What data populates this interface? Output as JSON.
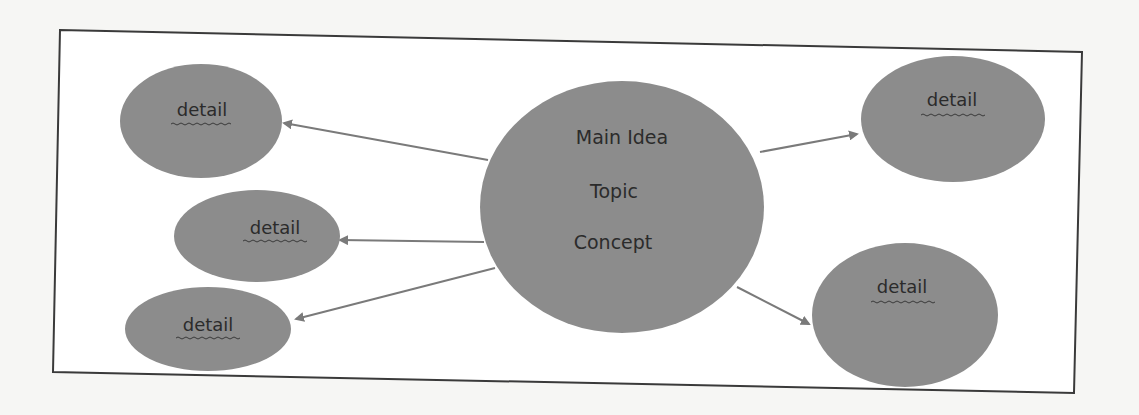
{
  "diagram": {
    "type": "concept-map",
    "central_node": {
      "lines": [
        "Main Idea",
        "Topic",
        "Concept"
      ]
    },
    "detail_nodes": [
      {
        "label": "detail",
        "position": "top-left"
      },
      {
        "label": "detail",
        "position": "middle-left"
      },
      {
        "label": "detail",
        "position": "bottom-left"
      },
      {
        "label": "detail",
        "position": "top-right"
      },
      {
        "label": "detail",
        "position": "bottom-right"
      }
    ],
    "edges": [
      {
        "from": "central",
        "to": "top-left",
        "style": "arrow"
      },
      {
        "from": "central",
        "to": "middle-left",
        "style": "arrow"
      },
      {
        "from": "central",
        "to": "bottom-left",
        "style": "arrow"
      },
      {
        "from": "central",
        "to": "top-right",
        "style": "arrow"
      },
      {
        "from": "central",
        "to": "bottom-right",
        "style": "arrow"
      }
    ],
    "colors": {
      "node_fill": "#8c8c8c",
      "edge": "#7a7a7a",
      "frame": "#3a3a3a",
      "text": "#2b2b2b",
      "background": "#f6f6f4"
    }
  }
}
